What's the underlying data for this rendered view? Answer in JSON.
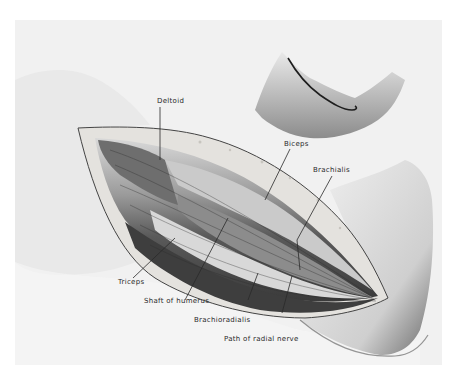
{
  "figure": {
    "labels": {
      "deltoid": "Deltoid",
      "biceps": "Biceps",
      "brachialis": "Brachialis",
      "triceps": "Triceps",
      "shaft_of_humerus": "Shaft of humerus",
      "brachioradialis": "Brachioradialis",
      "path_of_radial_nerve": "Path of radial nerve"
    },
    "inset": "Skin incision line on flexed arm",
    "colors": {
      "background": "#ffffff",
      "panel": "#f1f1f1",
      "ink": "#2a2a2a",
      "skin_shadow": "#9a9a9a",
      "muscle_dark": "#4a4a4a",
      "muscle_light": "#cfcfcf",
      "wound_edge": "#e2e0dc"
    }
  }
}
